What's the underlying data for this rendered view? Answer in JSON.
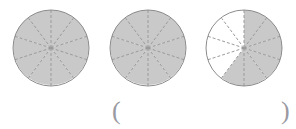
{
  "page": {
    "background_color": "#ffffff",
    "cut_off_header_text": "",
    "kind": "fraction-model-worksheet-item"
  },
  "style": {
    "shaded_fill": "#c9c9c9",
    "unshaded_fill": "#ffffff",
    "outline_color": "#8c8c8c",
    "spoke_color": "#9b9b9b",
    "text_color": "#9a9aa2"
  },
  "figures": [
    {
      "id": "circle-1",
      "label": "circle-model-1",
      "total_parts": 10,
      "shaded_parts": 10,
      "fraction": "10/10",
      "value": 1.0,
      "sector_states": [
        "shaded",
        "shaded",
        "shaded",
        "shaded",
        "shaded",
        "shaded",
        "shaded",
        "shaded",
        "shaded",
        "shaded"
      ]
    },
    {
      "id": "circle-2",
      "label": "circle-model-2",
      "total_parts": 10,
      "shaded_parts": 10,
      "fraction": "10/10",
      "value": 1.0,
      "sector_states": [
        "shaded",
        "shaded",
        "shaded",
        "shaded",
        "shaded",
        "shaded",
        "shaded",
        "shaded",
        "shaded",
        "shaded"
      ]
    },
    {
      "id": "circle-3",
      "label": "circle-model-3",
      "total_parts": 10,
      "shaded_parts": 6,
      "fraction": "6/10",
      "value": 0.6,
      "sector_states": [
        "shaded",
        "shaded",
        "shaded",
        "shaded",
        "shaded",
        "unshaded",
        "unshaded",
        "unshaded",
        "unshaded",
        "shaded"
      ]
    }
  ],
  "answer": {
    "open_paren": "(",
    "close_paren": ")",
    "value": ""
  }
}
